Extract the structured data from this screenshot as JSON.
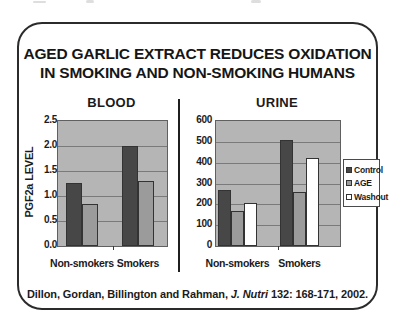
{
  "title": {
    "line1": "AGED GARLIC EXTRACT REDUCES OXIDATION",
    "line2": "IN SMOKING AND NON-SMOKING HUMANS"
  },
  "citation": {
    "authors": "Dillon, Gordan, Billington and Rahman, ",
    "journal": "J. Nutri",
    "reference": " 132: 168-171, 2002."
  },
  "colors": {
    "plot_background": "#b5b5b5",
    "gridline": "#7a7a7a",
    "control": "#474747",
    "age": "#9b9b9b",
    "washout": "#ffffff",
    "bar_border": "#333333"
  },
  "chart_data": [
    {
      "type": "bar",
      "title": "BLOOD",
      "ylabel": "PGF2a LEVEL",
      "ylim": [
        0,
        2.5
      ],
      "yticks": [
        0,
        0.5,
        1.0,
        1.5,
        2.0,
        2.5
      ],
      "ytick_labels": [
        "0.0",
        "0.5",
        "1.0",
        "1.5",
        "2.0",
        "2.5"
      ],
      "categories": [
        "Non-smokers",
        "Smokers"
      ],
      "series": [
        {
          "name": "Control",
          "color": "#474747",
          "values": [
            1.25,
            2.0
          ]
        },
        {
          "name": "AGE",
          "color": "#9b9b9b",
          "values": [
            0.85,
            1.3
          ]
        }
      ],
      "grid": true,
      "legend": false
    },
    {
      "type": "bar",
      "title": "URINE",
      "ylabel": "",
      "ylim": [
        0,
        600
      ],
      "yticks": [
        0,
        100,
        200,
        300,
        400,
        500,
        600
      ],
      "ytick_labels": [
        "0",
        "100",
        "200",
        "300",
        "400",
        "500",
        "600"
      ],
      "categories": [
        "Non-smokers",
        "Smokers"
      ],
      "series": [
        {
          "name": "Control",
          "color": "#474747",
          "values": [
            270,
            510
          ]
        },
        {
          "name": "AGE",
          "color": "#9b9b9b",
          "values": [
            170,
            260
          ]
        },
        {
          "name": "Washout",
          "color": "#ffffff",
          "values": [
            205,
            420
          ]
        }
      ],
      "grid": true,
      "legend": true,
      "legend_position": "right"
    }
  ]
}
